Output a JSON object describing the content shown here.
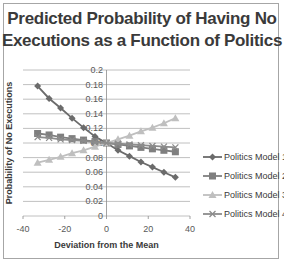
{
  "chart_data": {
    "type": "line",
    "title": "Predicted Probability of Having No Executions as a Function of Politics",
    "title_lines": [
      "Predicted Probability of Having No",
      "Executions as a Function of Politics"
    ],
    "xlabel": "Deviation from the Mean",
    "ylabel": "Probability of No Executions",
    "xlim": [
      -40,
      40
    ],
    "ylim": [
      0,
      0.2
    ],
    "xticks": [
      "-40",
      "-20",
      "0",
      "20",
      "40"
    ],
    "yticks": [
      "0",
      "0.02",
      "0.04",
      "0.06",
      "0.08",
      "0.1",
      "0.12",
      "0.14",
      "0.16",
      "0.18",
      "0.2"
    ],
    "grid": true,
    "legend_position": "right",
    "x": [
      -33,
      -27.5,
      -22,
      -16.5,
      -11,
      -5.5,
      0,
      5.5,
      11,
      16.5,
      22,
      27.5,
      33
    ],
    "series": [
      {
        "name": "Politics Model 1",
        "marker": "diamond",
        "color": "#6b6b6b",
        "values": [
          0.178,
          0.161,
          0.148,
          0.134,
          0.121,
          0.109,
          0.1,
          0.09,
          0.082,
          0.074,
          0.067,
          0.06,
          0.053
        ]
      },
      {
        "name": "Politics Model 2",
        "marker": "square",
        "color": "#7f7f7f",
        "values": [
          0.113,
          0.111,
          0.108,
          0.106,
          0.104,
          0.102,
          0.1,
          0.098,
          0.096,
          0.094,
          0.092,
          0.09,
          0.088
        ]
      },
      {
        "name": "Politics Model 3",
        "marker": "triangle",
        "color": "#bfbfbf",
        "values": [
          0.073,
          0.077,
          0.081,
          0.086,
          0.09,
          0.095,
          0.1,
          0.105,
          0.11,
          0.116,
          0.121,
          0.127,
          0.134
        ]
      },
      {
        "name": "Politics Model 4",
        "marker": "x",
        "color": "#8c8c8c",
        "values": [
          0.108,
          0.107,
          0.105,
          0.104,
          0.103,
          0.101,
          0.1,
          0.099,
          0.098,
          0.097,
          0.096,
          0.095,
          0.094
        ]
      }
    ]
  }
}
